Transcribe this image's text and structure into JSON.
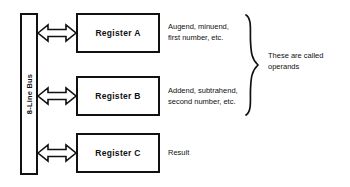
{
  "diagram": {
    "bus": {
      "label": "8-Line Bus",
      "name": "8-line-bus"
    },
    "registers": [
      {
        "label": "Register A",
        "note": "Augend, minuend,\nfirst number, etc."
      },
      {
        "label": "Register B",
        "note": "Addend, subtrahend,\nsecond number, etc."
      },
      {
        "label": "Register C",
        "note": "Result"
      }
    ],
    "brace_note": "These are called\noperands",
    "connectors": [
      {
        "label": "double-headed arrow bus to Register A"
      },
      {
        "label": "double-headed arrow bus to Register B"
      },
      {
        "label": "double-headed arrow bus to Register C"
      }
    ],
    "colors": {
      "stroke": "#111111",
      "background": "#ffffff",
      "text": "#111111"
    }
  }
}
